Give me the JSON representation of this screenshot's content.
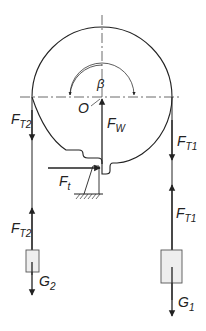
{
  "diagram": {
    "type": "free-body diagram of pulley with two hanging loads",
    "labels": {
      "angle": "β",
      "center": "O",
      "ft2_top": {
        "main": "F",
        "sub": "T2"
      },
      "fw": {
        "main": "F",
        "sub": "W"
      },
      "ft1_top": {
        "main": "F",
        "sub": "T1"
      },
      "ft": {
        "main": "F",
        "sub": "t"
      },
      "ft2_bottom": {
        "main": "F",
        "sub": "T2"
      },
      "ft1_bottom": {
        "main": "F",
        "sub": "T1"
      },
      "g2": {
        "main": "G",
        "sub": "2"
      },
      "g1": {
        "main": "G",
        "sub": "1"
      }
    },
    "colors": {
      "line": "#222222",
      "mass_fill": "#eeeeee"
    }
  }
}
